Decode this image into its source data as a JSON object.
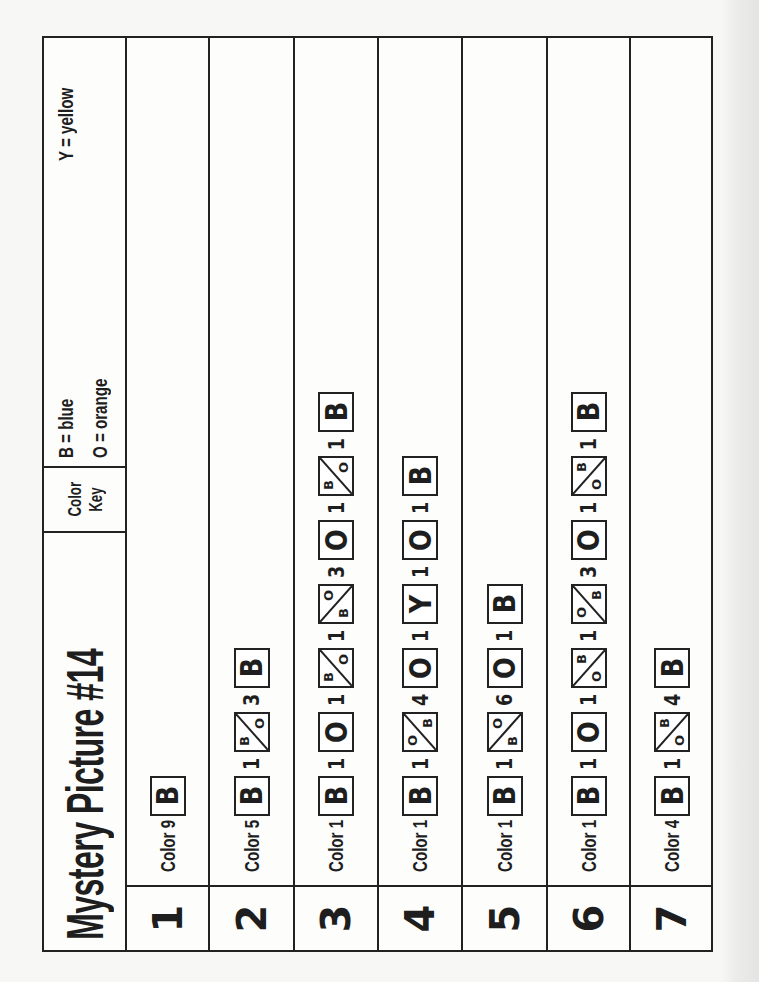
{
  "page": {
    "title": "Mystery Picture #14",
    "orientation": "rotated 90 degrees counter-clockwise"
  },
  "color_key": {
    "label_line1": "Color",
    "label_line2": "Key",
    "entries": [
      {
        "code": "B",
        "text": "B = blue",
        "color": "#1f4fbf"
      },
      {
        "code": "O",
        "text": "O = orange",
        "color": "#f08a1c"
      },
      {
        "code": "Y",
        "text": "Y = yellow",
        "color": "#f2d21b"
      }
    ]
  },
  "rows": [
    {
      "number": "1",
      "label": "Color 9",
      "items": [
        {
          "type": "solid",
          "code": "B"
        }
      ]
    },
    {
      "number": "2",
      "label": "Color 5",
      "items": [
        {
          "type": "solid",
          "code": "B"
        },
        {
          "type": "count",
          "value": "1"
        },
        {
          "type": "split",
          "diag": "bl-tr",
          "top": "B",
          "bottom": "O",
          "layout": "top-right/bottom-left-of-diagonal",
          "upper": "B",
          "lower": "O"
        },
        {
          "type": "count",
          "value": "3"
        },
        {
          "type": "solid",
          "code": "B"
        }
      ]
    },
    {
      "number": "3",
      "label": "Color 1",
      "items": [
        {
          "type": "solid",
          "code": "B"
        },
        {
          "type": "count",
          "value": "1"
        },
        {
          "type": "solid",
          "code": "O"
        },
        {
          "type": "count",
          "value": "1"
        },
        {
          "type": "split",
          "diag": "bl-tr",
          "upper": "B",
          "lower": "O"
        },
        {
          "type": "count",
          "value": "1"
        },
        {
          "type": "split",
          "diag": "tl-br",
          "upper": "O",
          "lower": "B"
        },
        {
          "type": "count",
          "value": "3"
        },
        {
          "type": "solid",
          "code": "O"
        },
        {
          "type": "count",
          "value": "1"
        },
        {
          "type": "split",
          "diag": "bl-tr",
          "upper": "B",
          "lower": "O"
        },
        {
          "type": "count",
          "value": "1"
        },
        {
          "type": "solid",
          "code": "B"
        }
      ]
    },
    {
      "number": "4",
      "label": "Color 1",
      "items": [
        {
          "type": "solid",
          "code": "B"
        },
        {
          "type": "count",
          "value": "1"
        },
        {
          "type": "split",
          "diag": "bl-tr",
          "upper": "O",
          "lower": "B"
        },
        {
          "type": "count",
          "value": "4"
        },
        {
          "type": "solid",
          "code": "O"
        },
        {
          "type": "count",
          "value": "1"
        },
        {
          "type": "solid",
          "code": "Y"
        },
        {
          "type": "count",
          "value": "1"
        },
        {
          "type": "solid",
          "code": "O"
        },
        {
          "type": "count",
          "value": "1"
        },
        {
          "type": "solid",
          "code": "B"
        }
      ]
    },
    {
      "number": "5",
      "label": "Color 1",
      "items": [
        {
          "type": "solid",
          "code": "B"
        },
        {
          "type": "count",
          "value": "1"
        },
        {
          "type": "split",
          "diag": "tl-br",
          "upper": "O",
          "lower": "B"
        },
        {
          "type": "count",
          "value": "6"
        },
        {
          "type": "solid",
          "code": "O"
        },
        {
          "type": "count",
          "value": "1"
        },
        {
          "type": "solid",
          "code": "B"
        }
      ]
    },
    {
      "number": "6",
      "label": "Color 1",
      "items": [
        {
          "type": "solid",
          "code": "B"
        },
        {
          "type": "count",
          "value": "1"
        },
        {
          "type": "solid",
          "code": "O"
        },
        {
          "type": "count",
          "value": "1"
        },
        {
          "type": "split",
          "diag": "tl-br",
          "upper": "B",
          "lower": "O"
        },
        {
          "type": "count",
          "value": "1"
        },
        {
          "type": "split",
          "diag": "bl-tr",
          "upper": "O",
          "lower": "B"
        },
        {
          "type": "count",
          "value": "3"
        },
        {
          "type": "solid",
          "code": "O"
        },
        {
          "type": "count",
          "value": "1"
        },
        {
          "type": "split",
          "diag": "tl-br",
          "upper": "B",
          "lower": "O"
        },
        {
          "type": "count",
          "value": "1"
        },
        {
          "type": "solid",
          "code": "B"
        }
      ]
    },
    {
      "number": "7",
      "label": "Color 4",
      "items": [
        {
          "type": "solid",
          "code": "B"
        },
        {
          "type": "count",
          "value": "1"
        },
        {
          "type": "split",
          "diag": "tl-br",
          "upper": "B",
          "lower": "O"
        },
        {
          "type": "count",
          "value": "4"
        },
        {
          "type": "solid",
          "code": "B"
        }
      ]
    }
  ]
}
